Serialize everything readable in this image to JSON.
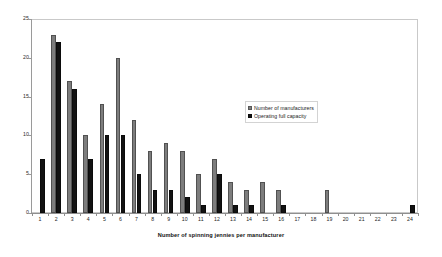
{
  "chart_data": {
    "type": "bar",
    "title": "",
    "subtitle": "",
    "xlabel": "Number of spinning jennies per manufacturer",
    "ylabel": "",
    "ylim": [
      0,
      25
    ],
    "ytick_labels": [
      "0",
      "5",
      "10",
      "15",
      "20",
      "25"
    ],
    "yticks": [
      0,
      5,
      10,
      15,
      20,
      25
    ],
    "grid": false,
    "legend_position": "inside-right",
    "categories": [
      "1",
      "2",
      "3",
      "4",
      "5",
      "6",
      "7",
      "8",
      "9",
      "10",
      "11",
      "12",
      "13",
      "14",
      "15",
      "16",
      "17",
      "18",
      "19",
      "20",
      "21",
      "22",
      "23",
      "24"
    ],
    "series": [
      {
        "name": "Number of manufacturers",
        "color": "#7d7d7d",
        "values": [
          0,
          23,
          17,
          10,
          14,
          20,
          12,
          8,
          9,
          8,
          5,
          7,
          4,
          3,
          4,
          3,
          0,
          0,
          3,
          0,
          0,
          0,
          0,
          0
        ]
      },
      {
        "name": "Operating full capacity",
        "color": "#121212",
        "values": [
          7,
          22,
          16,
          7,
          10,
          10,
          5,
          3,
          3,
          2,
          1,
          5,
          1,
          1,
          0,
          1,
          0,
          0,
          0,
          0,
          0,
          0,
          0,
          1
        ]
      }
    ]
  },
  "legend": {
    "items": [
      {
        "label": "Number of manufacturers"
      },
      {
        "label": "Operating full capacity"
      }
    ]
  }
}
